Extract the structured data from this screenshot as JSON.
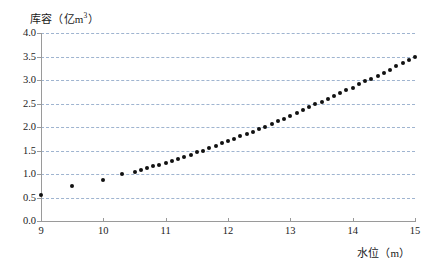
{
  "chart_data": {
    "type": "scatter",
    "title": "",
    "xlabel": "水位（m）",
    "ylabel": "库容（亿m³）",
    "ylabel_main": "库容（亿m",
    "ylabel_sup": "3",
    "ylabel_tail": "）",
    "xlim": [
      9,
      15
    ],
    "ylim": [
      0.0,
      4.0
    ],
    "grid": true,
    "grid_axis": "y",
    "grid_style": "dashed",
    "grid_color": "#8fa8c8",
    "legend": "none",
    "marker_color": "#111111",
    "marker_shape": "circle",
    "xticks": [
      9,
      10,
      11,
      12,
      13,
      14,
      15
    ],
    "xtick_labels": [
      "9",
      "10",
      "11",
      "12",
      "13",
      "14",
      "15"
    ],
    "yticks": [
      0.0,
      0.5,
      1.0,
      1.5,
      2.0,
      2.5,
      3.0,
      3.5,
      4.0
    ],
    "ytick_labels": [
      "0.0",
      "0.5",
      "1.0",
      "1.5",
      "2.0",
      "2.5",
      "3.0",
      "3.5",
      "4.0"
    ],
    "x": [
      9.0,
      9.5,
      10.0,
      10.3,
      10.5,
      10.6,
      10.7,
      10.8,
      10.9,
      11.0,
      11.1,
      11.2,
      11.3,
      11.4,
      11.5,
      11.6,
      11.7,
      11.8,
      11.9,
      12.0,
      12.1,
      12.2,
      12.3,
      12.4,
      12.5,
      12.6,
      12.7,
      12.8,
      12.9,
      13.0,
      13.1,
      13.2,
      13.3,
      13.4,
      13.5,
      13.6,
      13.7,
      13.8,
      13.9,
      14.0,
      14.1,
      14.2,
      14.3,
      14.4,
      14.5,
      14.6,
      14.7,
      14.8,
      14.9,
      15.0
    ],
    "y": [
      0.55,
      0.75,
      0.87,
      1.0,
      1.05,
      1.08,
      1.12,
      1.16,
      1.2,
      1.24,
      1.28,
      1.32,
      1.37,
      1.41,
      1.46,
      1.5,
      1.55,
      1.6,
      1.65,
      1.7,
      1.75,
      1.8,
      1.85,
      1.9,
      1.96,
      2.01,
      2.07,
      2.12,
      2.18,
      2.24,
      2.3,
      2.36,
      2.42,
      2.48,
      2.54,
      2.6,
      2.66,
      2.72,
      2.78,
      2.84,
      2.91,
      2.97,
      3.03,
      3.09,
      3.15,
      3.22,
      3.29,
      3.36,
      3.43,
      3.5
    ]
  }
}
